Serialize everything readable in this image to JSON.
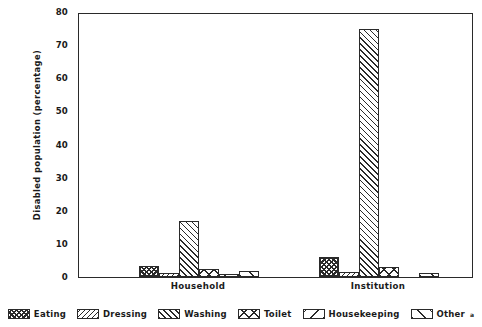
{
  "chart_data": {
    "type": "bar",
    "title": "",
    "xlabel": "",
    "ylabel": "Disabled population (percentage)",
    "ylim": [
      0,
      80
    ],
    "yticks": [
      0,
      10,
      20,
      30,
      40,
      50,
      60,
      70,
      80
    ],
    "grid": false,
    "legend_position": "bottom",
    "categories": [
      "Household",
      "Institution"
    ],
    "series": [
      {
        "name": "Eating",
        "values": [
          3.3,
          6.0
        ]
      },
      {
        "name": "Dressing",
        "values": [
          1.2,
          1.5
        ]
      },
      {
        "name": "Washing",
        "values": [
          17.0,
          75.0
        ]
      },
      {
        "name": "Toilet",
        "values": [
          2.5,
          3.0
        ]
      },
      {
        "name": "Housekeeping",
        "values": [
          1.0,
          0.0
        ]
      },
      {
        "name": "Other",
        "values": [
          1.8,
          1.2
        ]
      }
    ]
  },
  "axis": {
    "y_title": "Disabled population (percentage)",
    "y_tick_labels": [
      "80",
      "70",
      "60",
      "50",
      "40",
      "30",
      "20",
      "10",
      "0"
    ],
    "x_group_labels": [
      "Household",
      "Institution"
    ]
  },
  "legend": {
    "items": [
      {
        "label": "Eating",
        "pattern": "checker-hatch-swatch",
        "footnote": ""
      },
      {
        "label": "Dressing",
        "pattern": "backslash-hatch-swatch",
        "footnote": ""
      },
      {
        "label": "Washing",
        "pattern": "slash-hatch-swatch",
        "footnote": ""
      },
      {
        "label": "Toilet",
        "pattern": "cross-hatch-swatch",
        "footnote": ""
      },
      {
        "label": "Housekeeping",
        "pattern": "wide-backslash-swatch",
        "footnote": ""
      },
      {
        "label": "Other",
        "pattern": "wide-slash-swatch",
        "footnote": "a"
      }
    ]
  }
}
